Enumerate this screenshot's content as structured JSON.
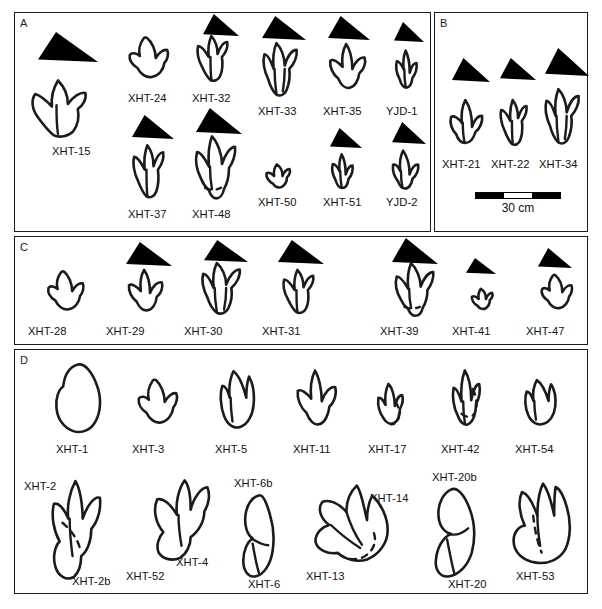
{
  "figure": {
    "panels": [
      {
        "id": "A",
        "letter": "A",
        "x": 14,
        "y": 12,
        "w": 417,
        "h": 220,
        "tracks": [
          {
            "name": "XHT-15",
            "label": "XHT-15",
            "lx": 52,
            "ly": 145,
            "tx": 20,
            "ty": 78,
            "tw": 76,
            "th": 62,
            "shape": "theropod-3toe-broad",
            "tri": {
              "x": 38,
              "y": 32,
              "w": 60,
              "th": 30,
              "skew": "right"
            }
          },
          {
            "name": "XHT-24",
            "label": "XHT-24",
            "lx": 128,
            "ly": 92,
            "tx": 125,
            "ty": 34,
            "tw": 48,
            "th": 50,
            "shape": "theropod-3toe-round",
            "tri": null
          },
          {
            "name": "XHT-32",
            "label": "XHT-32",
            "lx": 192,
            "ly": 92,
            "tx": 192,
            "ty": 34,
            "tw": 44,
            "th": 50,
            "shape": "theropod-3toe-slim",
            "tri": {
              "x": 203,
              "y": 14,
              "w": 36,
              "th": 22,
              "skew": "right"
            }
          },
          {
            "name": "XHT-33",
            "label": "XHT-33",
            "lx": 258,
            "ly": 105,
            "tx": 258,
            "ty": 42,
            "tw": 46,
            "th": 56,
            "shape": "theropod-3toe-long",
            "tri": {
              "x": 262,
              "y": 16,
              "w": 44,
              "th": 24,
              "skew": "right"
            }
          },
          {
            "name": "XHT-35",
            "label": "XHT-35",
            "lx": 323,
            "ly": 105,
            "tx": 325,
            "ty": 42,
            "tw": 44,
            "th": 52,
            "shape": "theropod-3toe-open",
            "tri": {
              "x": 328,
              "y": 16,
              "w": 42,
              "th": 24,
              "skew": "right"
            }
          },
          {
            "name": "YJD-1",
            "label": "YJD-1",
            "lx": 386,
            "ly": 105,
            "tx": 390,
            "ty": 48,
            "tw": 34,
            "th": 44,
            "shape": "theropod-3toe-narrow",
            "tri": {
              "x": 394,
              "y": 22,
              "w": 30,
              "th": 20,
              "skew": "right"
            }
          },
          {
            "name": "XHT-37",
            "label": "XHT-37",
            "lx": 128,
            "ly": 208,
            "tx": 128,
            "ty": 143,
            "tw": 44,
            "th": 58,
            "shape": "theropod-3toe-slim",
            "tri": {
              "x": 132,
              "y": 115,
              "w": 42,
              "th": 24,
              "skew": "right"
            }
          },
          {
            "name": "XHT-48",
            "label": "XHT-48",
            "lx": 192,
            "ly": 208,
            "tx": 190,
            "ty": 135,
            "tw": 50,
            "th": 66,
            "shape": "theropod-3toe-heel",
            "tri": {
              "x": 196,
              "y": 108,
              "w": 46,
              "th": 26,
              "skew": "right"
            }
          },
          {
            "name": "XHT-50",
            "label": "XHT-50",
            "lx": 258,
            "ly": 196,
            "tx": 262,
            "ty": 160,
            "tw": 32,
            "th": 32,
            "shape": "theropod-3toe-small",
            "tri": null
          },
          {
            "name": "XHT-51",
            "label": "XHT-51",
            "lx": 323,
            "ly": 196,
            "tx": 326,
            "ty": 152,
            "tw": 34,
            "th": 40,
            "shape": "theropod-3toe-narrow",
            "tri": {
              "x": 330,
              "y": 128,
              "w": 32,
              "th": 20,
              "skew": "right"
            }
          },
          {
            "name": "YJD-2",
            "label": "YJD-2",
            "lx": 386,
            "ly": 196,
            "tx": 388,
            "ty": 148,
            "tw": 36,
            "th": 44,
            "shape": "theropod-3toe-thick",
            "tri": {
              "x": 392,
              "y": 122,
              "w": 34,
              "th": 22,
              "skew": "right"
            }
          }
        ]
      },
      {
        "id": "B",
        "letter": "B",
        "x": 434,
        "y": 12,
        "w": 154,
        "h": 220,
        "tracks": [
          {
            "name": "XHT-21",
            "label": "XHT-21",
            "lx": 442,
            "ly": 158,
            "tx": 446,
            "ty": 98,
            "tw": 42,
            "th": 50,
            "shape": "theropod-3toe-broad2",
            "tri": {
              "x": 452,
              "y": 58,
              "w": 38,
              "th": 24,
              "skew": "right"
            }
          },
          {
            "name": "XHT-22",
            "label": "XHT-22",
            "lx": 491,
            "ly": 158,
            "tx": 496,
            "ty": 98,
            "tw": 38,
            "th": 50,
            "shape": "theropod-3toe-slim",
            "tri": {
              "x": 500,
              "y": 58,
              "w": 36,
              "th": 22,
              "skew": "right"
            }
          },
          {
            "name": "XHT-34",
            "label": "XHT-34",
            "lx": 539,
            "ly": 158,
            "tx": 540,
            "ty": 88,
            "tw": 46,
            "th": 58,
            "shape": "theropod-3toe-long",
            "tri": {
              "x": 545,
              "y": 48,
              "w": 44,
              "th": 28,
              "skew": "right"
            }
          }
        ],
        "scalebar": {
          "name": "scale-bar",
          "x": 475,
          "y": 192,
          "w": 86,
          "caption": "30 cm"
        }
      },
      {
        "id": "C",
        "letter": "C",
        "x": 14,
        "y": 236,
        "w": 574,
        "h": 109,
        "tracks": [
          {
            "name": "XHT-28",
            "label": "XHT-28",
            "lx": 28,
            "ly": 325,
            "tx": 44,
            "ly2": 0,
            "ty": 268,
            "tw": 44,
            "th": 48,
            "shape": "theropod-3toe-round",
            "tri": null
          },
          {
            "name": "XHT-29",
            "label": "XHT-29",
            "lx": 106,
            "ly": 325,
            "tx": 124,
            "ty": 268,
            "tw": 42,
            "th": 48,
            "shape": "theropod-3toe-open",
            "tri": {
              "x": 126,
              "y": 242,
              "w": 46,
              "th": 24,
              "skew": "right"
            }
          },
          {
            "name": "XHT-30",
            "label": "XHT-30",
            "lx": 184,
            "ly": 325,
            "tx": 196,
            "ty": 262,
            "tw": 52,
            "th": 54,
            "shape": "theropod-3toe-long",
            "tri": {
              "x": 204,
              "y": 240,
              "w": 44,
              "th": 22,
              "skew": "right"
            }
          },
          {
            "name": "XHT-31",
            "label": "XHT-31",
            "lx": 262,
            "ly": 325,
            "tx": 278,
            "ty": 268,
            "tw": 44,
            "th": 48,
            "shape": "theropod-3toe-slim",
            "tri": {
              "x": 278,
              "y": 240,
              "w": 46,
              "th": 24,
              "skew": "right"
            }
          },
          {
            "name": "XHT-39",
            "label": "XHT-39",
            "lx": 380,
            "ly": 325,
            "tx": 390,
            "ty": 262,
            "tw": 48,
            "th": 56,
            "shape": "theropod-3toe-heel",
            "tri": {
              "x": 392,
              "y": 238,
              "w": 46,
              "th": 26,
              "skew": "right"
            }
          },
          {
            "name": "XHT-41",
            "label": "XHT-41",
            "lx": 452,
            "ly": 325,
            "tx": 468,
            "ty": 285,
            "tw": 28,
            "th": 28,
            "shape": "theropod-3toe-small",
            "tri": {
              "x": 466,
              "y": 258,
              "w": 30,
              "th": 16,
              "skew": "right"
            }
          },
          {
            "name": "XHT-47",
            "label": "XHT-47",
            "lx": 526,
            "ly": 325,
            "tx": 538,
            "ty": 272,
            "tw": 38,
            "th": 42,
            "shape": "theropod-3toe-round",
            "tri": {
              "x": 538,
              "y": 248,
              "w": 34,
              "th": 20,
              "skew": "right"
            }
          }
        ]
      },
      {
        "id": "D",
        "letter": "D",
        "x": 14,
        "y": 349,
        "w": 574,
        "h": 245,
        "tracks": [
          {
            "name": "XHT-1",
            "label": "XHT-1",
            "lx": 56,
            "ly": 443,
            "tx": 52,
            "ty": 362,
            "tw": 56,
            "th": 72,
            "shape": "sauropod-oval",
            "tri": null
          },
          {
            "name": "XHT-3",
            "label": "XHT-3",
            "lx": 132,
            "ly": 443,
            "tx": 134,
            "ty": 376,
            "tw": 48,
            "th": 54,
            "shape": "theropod-3toe-round",
            "tri": null
          },
          {
            "name": "XHT-5",
            "label": "XHT-5",
            "lx": 215,
            "ly": 443,
            "tx": 215,
            "ty": 366,
            "tw": 46,
            "th": 66,
            "shape": "theropod-2toe-bulb",
            "tri": null
          },
          {
            "name": "XHT-11",
            "label": "XHT-11",
            "lx": 293,
            "ly": 443,
            "tx": 292,
            "ty": 368,
            "tw": 48,
            "th": 64,
            "shape": "theropod-3toe-open",
            "tri": null
          },
          {
            "name": "XHT-17",
            "label": "XHT-17",
            "lx": 368,
            "ly": 443,
            "tx": 374,
            "ty": 380,
            "tw": 36,
            "th": 50,
            "shape": "theropod-3toe-partial",
            "tri": null
          },
          {
            "name": "XHT-42",
            "label": "XHT-42",
            "lx": 441,
            "ly": 443,
            "tx": 448,
            "ty": 368,
            "tw": 40,
            "th": 62,
            "shape": "theropod-3toe-partial2",
            "tri": null
          },
          {
            "name": "XHT-54",
            "label": "XHT-54",
            "lx": 515,
            "ly": 443,
            "tx": 520,
            "ty": 376,
            "tw": 42,
            "th": 52,
            "shape": "theropod-2toe-bulb",
            "tri": null
          },
          {
            "name": "XHT-2",
            "label": "XHT-2",
            "lx": 24,
            "ly": 480,
            "tx": 0,
            "ty": 0,
            "tw": 0,
            "th": 0,
            "shape": "none",
            "tri": null
          },
          {
            "name": "XHT-2b",
            "label": "XHT-2b",
            "lx": 72,
            "ly": 575,
            "tx": 38,
            "ty": 477,
            "tw": 72,
            "th": 104,
            "shape": "manus-pes-pair",
            "tri": null
          },
          {
            "name": "XHT-52",
            "label": "XHT-52",
            "lx": 126,
            "ly": 570,
            "tx": 0,
            "ty": 0,
            "tw": 0,
            "th": 0,
            "shape": "none",
            "tri": null
          },
          {
            "name": "XHT-4",
            "label": "XHT-4",
            "lx": 176,
            "ly": 556,
            "tx": 142,
            "ty": 477,
            "tw": 76,
            "th": 86,
            "shape": "manus-pes-pair2",
            "tri": null
          },
          {
            "name": "XHT-6b",
            "label": "XHT-6b",
            "lx": 234,
            "ly": 477,
            "tx": 0,
            "ty": 0,
            "tw": 0,
            "th": 0,
            "shape": "none",
            "tri": null
          },
          {
            "name": "XHT-6",
            "label": "XHT-6",
            "lx": 248,
            "ly": 578,
            "tx": 236,
            "ty": 492,
            "tw": 52,
            "th": 86,
            "shape": "stacked-pair",
            "tri": null
          },
          {
            "name": "XHT-14",
            "label": "XHT-14",
            "lx": 370,
            "ly": 492,
            "tx": 0,
            "ty": 0,
            "tw": 0,
            "th": 0,
            "shape": "none",
            "tri": null
          },
          {
            "name": "XHT-13",
            "label": "XHT-13",
            "lx": 306,
            "ly": 570,
            "tx": 312,
            "ty": 484,
            "tw": 86,
            "th": 82,
            "shape": "spread-4toe",
            "tri": null
          },
          {
            "name": "XHT-20b",
            "label": "XHT-20b",
            "lx": 432,
            "ly": 471,
            "tx": 0,
            "ty": 0,
            "tw": 0,
            "th": 0,
            "shape": "none",
            "tri": null
          },
          {
            "name": "XHT-20",
            "label": "XHT-20",
            "lx": 448,
            "ly": 578,
            "tx": 426,
            "ty": 486,
            "tw": 62,
            "th": 92,
            "shape": "stacked-pair2",
            "tri": null
          },
          {
            "name": "XHT-53",
            "label": "XHT-53",
            "lx": 516,
            "ly": 570,
            "tx": 508,
            "ty": 482,
            "tw": 70,
            "th": 84,
            "shape": "broad-4toe",
            "tri": null
          }
        ]
      }
    ]
  }
}
